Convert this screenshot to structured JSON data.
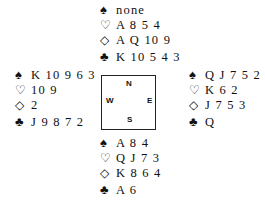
{
  "icons": {
    "spades": "♠",
    "hearts": "♡",
    "diamonds": "◇",
    "clubs": "♣"
  },
  "compass": {
    "north": "N",
    "south": "S",
    "west": "W",
    "east": "E"
  },
  "hands": {
    "north": {
      "spades": "none",
      "hearts": "A 8 5 4",
      "diamonds": "A Q 10 9",
      "clubs": "K 10 5 4 3"
    },
    "west": {
      "spades": "K 10 9 6 3",
      "hearts": "10 9",
      "diamonds": "2",
      "clubs": "J 9 8 7 2"
    },
    "east": {
      "spades": "Q J 7 5 2",
      "hearts": "K 6 2",
      "diamonds": "J 7 5 3",
      "clubs": "Q"
    },
    "south": {
      "spades": "A 8 4",
      "hearts": "Q J 7 3",
      "diamonds": "K 8 6 4",
      "clubs": "A 6"
    }
  }
}
